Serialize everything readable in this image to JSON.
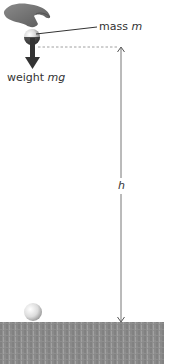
{
  "diagram": {
    "title": "",
    "labels": {
      "mass_prefix": "mass ",
      "mass_symbol": "m",
      "weight_prefix": "weight ",
      "weight_symbol": "mg",
      "height_symbol": "h"
    },
    "colors": {
      "background": "#ffffff",
      "ground": "#8c8c8c",
      "arrow": "#333333",
      "dimension_line": "#777777",
      "text": "#333333"
    },
    "elements": {
      "hand": "hand holding ball",
      "ball_top": "ball of mass m at height h",
      "weight_arrow": "downward force arrow",
      "height_arrow": "double-headed vertical dimension arrow",
      "ball_bottom": "ball resting on ground",
      "ground": "grass ground surface"
    }
  }
}
